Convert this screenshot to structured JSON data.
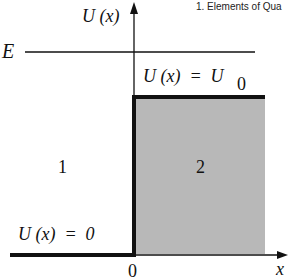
{
  "header": {
    "text": "1. Elements of Qua"
  },
  "axes": {
    "y_label": "U (x)",
    "x_label": "x",
    "origin_label": "0"
  },
  "energy": {
    "label": "E"
  },
  "regions": {
    "region_1": {
      "label": "1",
      "potential_label": "U (x)  =  0"
    },
    "region_2": {
      "label": "2",
      "potential_label_main": "U (x)  =  U",
      "potential_subscript": "0"
    }
  },
  "colors": {
    "line": "#111111",
    "barrier_fill": "#b8b8b8",
    "background": "#ffffff"
  }
}
